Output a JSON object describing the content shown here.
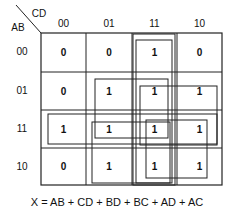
{
  "diagram": {
    "type": "karnaugh-map",
    "row_var_label": "AB",
    "col_var_label": "CD",
    "col_headers": [
      "00",
      "01",
      "11",
      "10"
    ],
    "row_headers": [
      "00",
      "01",
      "11",
      "10"
    ],
    "cells": [
      [
        "0",
        "0",
        "1",
        "0"
      ],
      [
        "0",
        "1",
        "1",
        "1"
      ],
      [
        "1",
        "1",
        "1",
        "1"
      ],
      [
        "0",
        "1",
        "1",
        "1"
      ]
    ],
    "groups": [
      {
        "term": "AB",
        "rows": [
          "11"
        ],
        "cols": [
          "00",
          "01",
          "11",
          "10"
        ]
      },
      {
        "term": "CD",
        "rows": [
          "00",
          "01",
          "11",
          "10"
        ],
        "cols": [
          "11"
        ]
      },
      {
        "term": "BD",
        "rows": [
          "01",
          "11"
        ],
        "cols": [
          "01",
          "11"
        ]
      },
      {
        "term": "BC",
        "rows": [
          "01",
          "11"
        ],
        "cols": [
          "11",
          "10"
        ]
      },
      {
        "term": "AD",
        "rows": [
          "11",
          "10"
        ],
        "cols": [
          "01",
          "11"
        ]
      },
      {
        "term": "AC",
        "rows": [
          "11",
          "10"
        ],
        "cols": [
          "11",
          "10"
        ]
      }
    ],
    "equation": "X = AB + CD + BD + BC + AD + AC"
  }
}
